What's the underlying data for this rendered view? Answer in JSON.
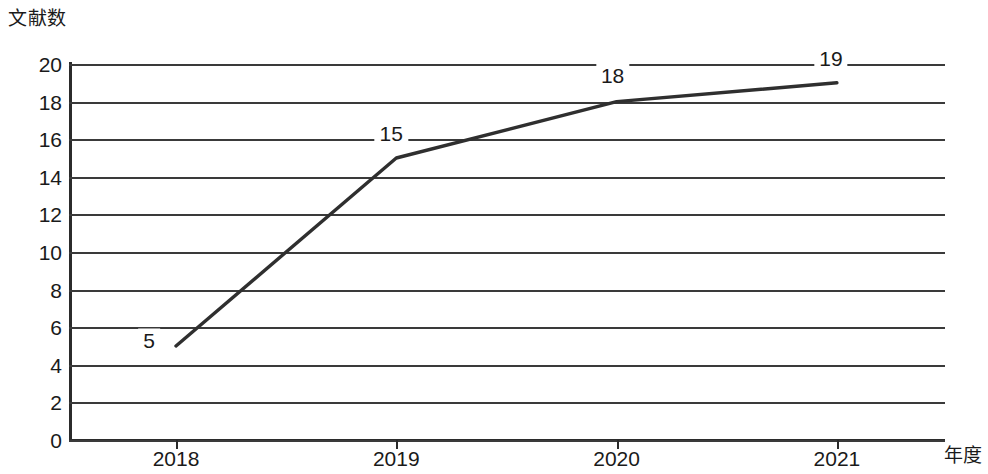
{
  "chart_data": {
    "type": "line",
    "title": "",
    "xlabel": "年度",
    "ylabel": "文献数",
    "categories": [
      "2018",
      "2019",
      "2020",
      "2021"
    ],
    "x": [
      2018,
      2019,
      2020,
      2021
    ],
    "values": [
      5,
      15,
      18,
      19
    ],
    "point_labels": [
      "5",
      "15",
      "18",
      "19"
    ],
    "series": [
      {
        "name": "文献数",
        "values": [
          5,
          15,
          18,
          19
        ]
      }
    ],
    "ylim": [
      0,
      20
    ],
    "ytick_step": 2,
    "ytick_labels": [
      "20",
      "18",
      "16",
      "14",
      "12",
      "10",
      "8",
      "6",
      "4",
      "2",
      "0"
    ],
    "ytick_values": [
      20,
      18,
      16,
      14,
      12,
      10,
      8,
      6,
      4,
      2,
      0
    ],
    "grid": true,
    "grid_axis": "y",
    "legend": false,
    "legend_position": "none",
    "line_color": "#2f2f2f",
    "grid_color": "#3a3a3a",
    "axis_color": "#2b2b2b",
    "background_color": "#ffffff"
  }
}
